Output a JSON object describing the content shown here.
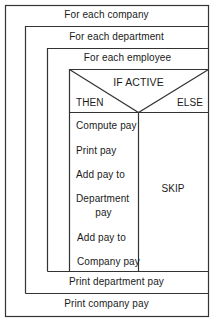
{
  "diagram": {
    "type": "nassi-shneiderman",
    "loops": {
      "company": "For each company",
      "department": "For each department",
      "employee": "For each employee"
    },
    "condition": {
      "label": "IF ACTIVE",
      "then_label": "THEN",
      "else_label": "ELSE"
    },
    "then_steps": [
      "Compute pay",
      "Print pay",
      "Add pay to",
      "Department",
      "pay",
      "Add pay to",
      "Company pay"
    ],
    "else_steps": [
      "SKIP"
    ],
    "after_department_loop": "Print department pay",
    "after_company_loop": "Print company pay",
    "line_color": "#333333"
  }
}
